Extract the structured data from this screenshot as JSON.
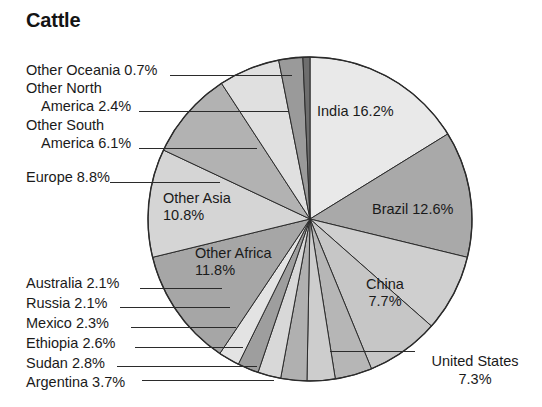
{
  "title": "Cattle",
  "chart_data": {
    "type": "pie",
    "title": "Cattle",
    "unit": "%",
    "start_angle_deg": 0,
    "direction": "clockwise",
    "legend": "none",
    "labels_mode": "slice-labels-with-leader-lines",
    "categories": [
      "India",
      "Brazil",
      "China",
      "United States",
      "Argentina",
      "Sudan",
      "Ethiopia",
      "Mexico",
      "Russia",
      "Australia",
      "Other Africa",
      "Other Asia",
      "Europe",
      "Other South America",
      "Other North America",
      "Other Oceania"
    ],
    "values": [
      16.2,
      12.6,
      7.7,
      7.3,
      3.7,
      2.8,
      2.6,
      2.3,
      2.1,
      2.1,
      11.8,
      10.8,
      8.8,
      6.1,
      2.4,
      0.7
    ],
    "colors": [
      "#e9e9e9",
      "#a9a9a9",
      "#cfcfcf",
      "#c6c6c6",
      "#b6b6b6",
      "#cdcdcd",
      "#b0b0b0",
      "#d8d8d8",
      "#9e9e9e",
      "#e3e3e3",
      "#a6a6a6",
      "#d5d5d5",
      "#b2b2b2",
      "#e0e0e0",
      "#9a9a9a",
      "#6e6e6e"
    ],
    "slice_labels": [
      {
        "name": "India",
        "text_line1": "India 16.2%",
        "text_line2": "",
        "placement": "inside"
      },
      {
        "name": "Brazil",
        "text_line1": "Brazil 12.6%",
        "text_line2": "",
        "placement": "inside"
      },
      {
        "name": "China",
        "text_line1": "China",
        "text_line2": "7.7%",
        "placement": "inside"
      },
      {
        "name": "United States",
        "text_line1": "United States",
        "text_line2": "7.3%",
        "placement": "outside-right"
      },
      {
        "name": "Argentina",
        "text_line1": "Argentina 3.7%",
        "text_line2": "",
        "placement": "outside-left"
      },
      {
        "name": "Sudan",
        "text_line1": "Sudan 2.8%",
        "text_line2": "",
        "placement": "outside-left"
      },
      {
        "name": "Ethiopia",
        "text_line1": "Ethiopia 2.6%",
        "text_line2": "",
        "placement": "outside-left"
      },
      {
        "name": "Mexico",
        "text_line1": "Mexico 2.3%",
        "text_line2": "",
        "placement": "outside-left"
      },
      {
        "name": "Russia",
        "text_line1": "Russia 2.1%",
        "text_line2": "",
        "placement": "outside-left"
      },
      {
        "name": "Australia",
        "text_line1": "Australia 2.1%",
        "text_line2": "",
        "placement": "outside-left"
      },
      {
        "name": "Other Africa",
        "text_line1": "Other Africa",
        "text_line2": "11.8%",
        "placement": "inside"
      },
      {
        "name": "Other Asia",
        "text_line1": "Other Asia",
        "text_line2": "10.8%",
        "placement": "inside"
      },
      {
        "name": "Europe",
        "text_line1": "Europe 8.8%",
        "text_line2": "",
        "placement": "outside-left"
      },
      {
        "name": "Other South America",
        "text_line1": "Other South",
        "text_line2": "America 6.1%",
        "placement": "outside-left"
      },
      {
        "name": "Other North America",
        "text_line1": "Other North",
        "text_line2": "America 2.4%",
        "placement": "outside-left"
      },
      {
        "name": "Other Oceania",
        "text_line1": "Other Oceania 0.7%",
        "text_line2": "",
        "placement": "outside-left"
      }
    ]
  },
  "labels": {
    "other_oceania": "Other Oceania 0.7%",
    "other_north_1": "Other North",
    "other_north_2": "America 2.4%",
    "other_south_1": "Other South",
    "other_south_2": "America 6.1%",
    "europe": "Europe 8.8%",
    "australia": "Australia 2.1%",
    "russia": "Russia 2.1%",
    "mexico": "Mexico 2.3%",
    "ethiopia": "Ethiopia 2.6%",
    "sudan": "Sudan 2.8%",
    "argentina": "Argentina 3.7%",
    "india": "India 16.2%",
    "brazil": "Brazil 12.6%",
    "china_1": "China",
    "china_2": "7.7%",
    "united_states_1": "United States",
    "united_states_2": "7.3%",
    "other_asia_1": "Other Asia",
    "other_asia_2": "10.8%",
    "other_africa_1": "Other Africa",
    "other_africa_2": "11.8%"
  }
}
